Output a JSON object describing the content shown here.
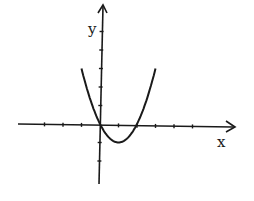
{
  "chart_data": {
    "type": "line",
    "title": "",
    "xlabel": "x",
    "ylabel": "y",
    "function": "y = x^2 - 2x",
    "series": [
      {
        "name": "parabola",
        "x": [
          -1.0,
          -0.5,
          0,
          0.5,
          1,
          1.5,
          2,
          2.5,
          3.0
        ],
        "values": [
          3.0,
          1.25,
          0,
          -0.75,
          -1,
          -0.75,
          0,
          1.25,
          3.0
        ]
      }
    ],
    "xlim": [
      -4.5,
      7.3
    ],
    "ylim": [
      -3.3,
      6.5
    ],
    "x_ticks": [
      -3,
      -2,
      -1,
      1,
      2,
      3,
      4,
      5
    ],
    "y_ticks": [
      -2,
      -1,
      1,
      2,
      3,
      4,
      5
    ],
    "tick_labels_shown": false,
    "grid": false,
    "legend": "none",
    "annotations": {
      "vertex": [
        1,
        -1
      ],
      "roots": [
        0,
        2
      ]
    },
    "colors": {
      "line": "#1a1a1a",
      "background": "#ffffff"
    }
  },
  "labels": {
    "x_axis": "x",
    "y_axis": "y"
  }
}
